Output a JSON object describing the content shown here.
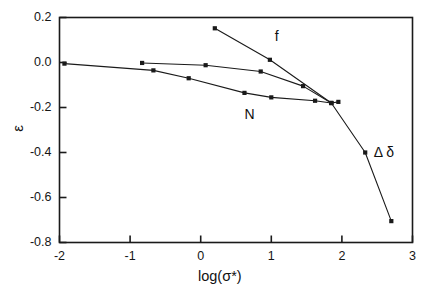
{
  "chart_data": {
    "type": "line",
    "title": "",
    "xlabel": "log(σ*)",
    "ylabel": "ε",
    "xlim": [
      -2,
      3
    ],
    "ylim": [
      -0.8,
      0.2
    ],
    "xticks": [
      "-2",
      "-1",
      "0",
      "1",
      "2",
      "3"
    ],
    "xtick_values": [
      -2,
      -1,
      0,
      1,
      2,
      3
    ],
    "yticks": [
      "0.2",
      "0.0",
      "-0.2",
      "-0.4",
      "-0.6",
      "-0.8"
    ],
    "ytick_values": [
      0.2,
      0.0,
      -0.2,
      -0.4,
      -0.6,
      -0.8
    ],
    "grid": false,
    "legend": "inline-annotations",
    "marker": "filled-square",
    "line_color": "#1a1a1a",
    "series": [
      {
        "name": "Δ δ",
        "label": "Δ δ",
        "label_x": 2.45,
        "label_y": -0.4,
        "points": [
          {
            "x": -1.93,
            "y": -0.005
          },
          {
            "x": -0.67,
            "y": -0.035
          },
          {
            "x": -0.17,
            "y": -0.07
          },
          {
            "x": 0.62,
            "y": -0.135
          },
          {
            "x": 1.0,
            "y": -0.155
          },
          {
            "x": 1.62,
            "y": -0.17
          },
          {
            "x": 1.85,
            "y": -0.18
          },
          {
            "x": 2.33,
            "y": -0.4
          },
          {
            "x": 2.7,
            "y": -0.705
          }
        ]
      },
      {
        "name": "N",
        "label": "N",
        "label_x": 0.62,
        "label_y": -0.235,
        "points": [
          {
            "x": -0.83,
            "y": -0.002
          },
          {
            "x": 0.07,
            "y": -0.012
          },
          {
            "x": 0.85,
            "y": -0.04
          },
          {
            "x": 1.45,
            "y": -0.105
          },
          {
            "x": 1.85,
            "y": -0.18
          },
          {
            "x": 1.95,
            "y": -0.175
          }
        ]
      },
      {
        "name": "f",
        "label": "f",
        "label_x": 1.05,
        "label_y": 0.115,
        "points": [
          {
            "x": 0.2,
            "y": 0.152
          },
          {
            "x": 0.98,
            "y": 0.012
          },
          {
            "x": 1.85,
            "y": -0.18
          }
        ]
      }
    ]
  },
  "axes": {
    "frame_color": "#1a1a1a"
  }
}
